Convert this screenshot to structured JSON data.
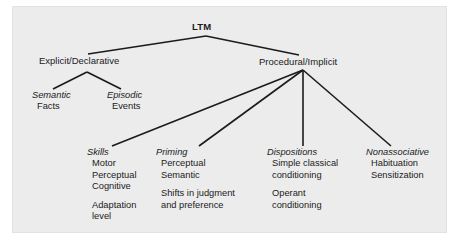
{
  "figure": {
    "type": "hierarchy-tree-diagram",
    "background_color": "#ececec",
    "page_color": "#ffffff",
    "line_color": "#1b1b1b",
    "text_color": "#1b1b1b"
  },
  "root": {
    "label": "LTM"
  },
  "level2": {
    "explicit": "Explicit/Declarative",
    "procedural": "Procedural/Implicit"
  },
  "explicit_children": [
    {
      "head": "Semantic",
      "item": "Facts"
    },
    {
      "head": "Episodic",
      "item": "Events"
    }
  ],
  "procedural_children": [
    {
      "head": "Skills",
      "items": [
        "Motor",
        "Perceptual",
        "Cognitive"
      ],
      "items2": [
        "Adaptation",
        "level"
      ]
    },
    {
      "head": "Priming",
      "items": [
        "Perceptual",
        "Semantic"
      ],
      "items2": [
        "Shifts in judgment",
        "and preference"
      ]
    },
    {
      "head": "Dispositions",
      "items": [
        "Simple classical",
        "conditioning"
      ],
      "items2": [
        "Operant",
        "conditioning"
      ]
    },
    {
      "head": "Nonassociative",
      "items": [
        "Habituation",
        "Sensitization"
      ],
      "items2": []
    }
  ]
}
